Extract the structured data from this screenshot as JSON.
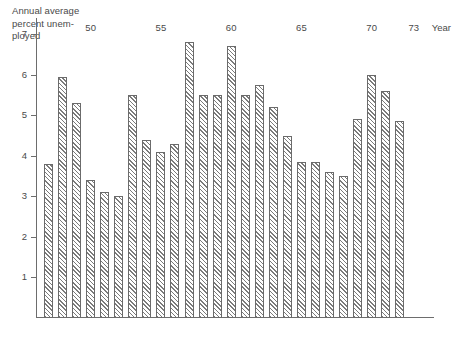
{
  "chart_data": {
    "type": "bar",
    "xlabel": "Year",
    "ylabel": "",
    "ylim": [
      0,
      7.4
    ],
    "xlim": [
      1946.5,
      1973.5
    ],
    "grid": false,
    "legend": null,
    "y_ticks": [
      1,
      2,
      3,
      4,
      5,
      6,
      7
    ],
    "y_tick_labels": [
      "1",
      "2",
      "3",
      "4",
      "5",
      "6",
      "7"
    ],
    "x_ticks": [
      1950,
      1955,
      1960,
      1965,
      1970,
      1973
    ],
    "x_tick_labels": [
      "50",
      "55",
      "60",
      "65",
      "70",
      "73"
    ],
    "categories": [
      "1947",
      "1948",
      "1949",
      "1950",
      "1951",
      "1952",
      "1953",
      "1954",
      "1955",
      "1956",
      "1957",
      "1958",
      "1959",
      "1960",
      "1961",
      "1962",
      "1963",
      "1964",
      "1965",
      "1966",
      "1967",
      "1968",
      "1969",
      "1970",
      "1971",
      "1972",
      "1973"
    ],
    "values": [
      3.8,
      5.95,
      5.3,
      3.4,
      3.1,
      3.0,
      5.5,
      4.4,
      4.1,
      4.3,
      6.8,
      5.5,
      5.5,
      6.7,
      5.5,
      5.75,
      5.2,
      4.5,
      3.85,
      3.85,
      3.6,
      3.5,
      4.9,
      6.0,
      5.6,
      4.85,
      0
    ]
  },
  "caption": {
    "text": "Annual average\npercent unem-\nployed"
  },
  "axis": {
    "x_title": "Year"
  }
}
